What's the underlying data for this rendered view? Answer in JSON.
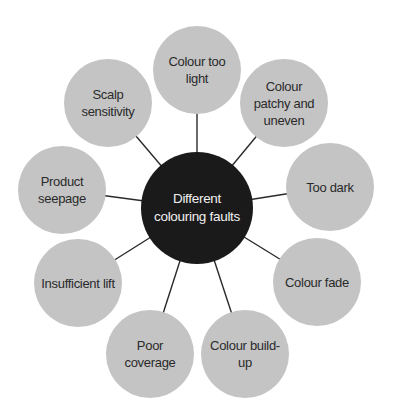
{
  "diagram": {
    "type": "spider",
    "center": {
      "label": "Different colouring faults",
      "x": 197,
      "y": 208,
      "r": 56,
      "fill": "#1a1a1a",
      "text_color": "#f0f0f0"
    },
    "node_fill": "#c4c4c4",
    "line_color": "#2a2a2a",
    "nodes": [
      {
        "label": "Colour too light",
        "x": 197,
        "y": 70,
        "r": 44
      },
      {
        "label": "Colour patchy and uneven",
        "x": 284,
        "y": 103,
        "r": 44
      },
      {
        "label": "Too dark",
        "x": 330,
        "y": 187,
        "r": 44
      },
      {
        "label": "Colour fade",
        "x": 317,
        "y": 282,
        "r": 44
      },
      {
        "label": "Colour build-up",
        "x": 245,
        "y": 354,
        "r": 44
      },
      {
        "label": "Poor coverage",
        "x": 150,
        "y": 354,
        "r": 44
      },
      {
        "label": "Insufficient lift",
        "x": 78,
        "y": 283,
        "r": 44
      },
      {
        "label": "Product seepage",
        "x": 62,
        "y": 190,
        "r": 44
      },
      {
        "label": "Scalp sensitivity",
        "x": 108,
        "y": 103,
        "r": 44
      }
    ]
  }
}
